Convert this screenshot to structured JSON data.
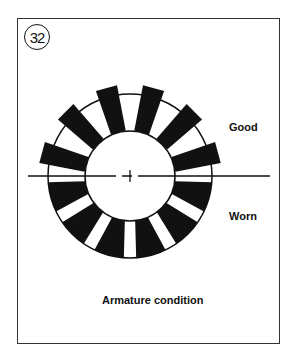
{
  "figure_number": "32",
  "labels": {
    "top_half": "Good",
    "bottom_half": "Worn"
  },
  "caption": "Armature condition",
  "diagram": {
    "center": [
      130,
      176
    ],
    "inner_radius": 45,
    "ring_outer_radius": 82,
    "good_segment_outer_radius": 91,
    "segment_color": "#111111",
    "segments_per_half": 6
  }
}
